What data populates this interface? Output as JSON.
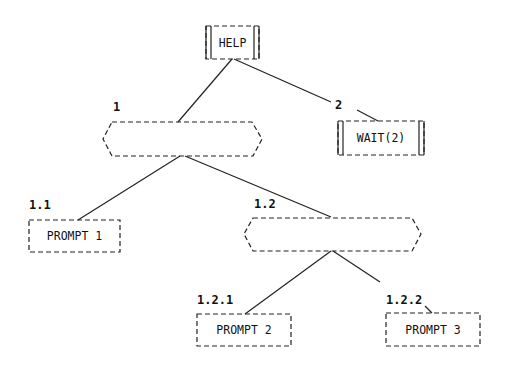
{
  "diagram": {
    "type": "tree",
    "root": {
      "id": "help",
      "label": "HELP",
      "shape": "double-bar-box"
    },
    "nodes": [
      {
        "id": "seq1",
        "number": "1",
        "label": "",
        "shape": "hexagon"
      },
      {
        "id": "wait",
        "number": "2",
        "label": "WAIT(2)",
        "shape": "double-bar-box"
      },
      {
        "id": "prompt1",
        "number": "1.1",
        "label": "PROMPT 1",
        "shape": "box"
      },
      {
        "id": "seq12",
        "number": "1.2",
        "label": "",
        "shape": "hexagon"
      },
      {
        "id": "prompt2",
        "number": "1.2.1",
        "label": "PROMPT 2",
        "shape": "box"
      },
      {
        "id": "prompt3",
        "number": "1.2.2",
        "label": "PROMPT 3",
        "shape": "box"
      }
    ],
    "edges": [
      [
        "help",
        "seq1"
      ],
      [
        "help",
        "wait"
      ],
      [
        "seq1",
        "prompt1"
      ],
      [
        "seq1",
        "seq12"
      ],
      [
        "seq12",
        "prompt2"
      ],
      [
        "seq12",
        "prompt3"
      ]
    ]
  },
  "labels": {
    "help": "HELP",
    "wait": "WAIT(2)",
    "n1": "1",
    "n2": "2",
    "n11": "1.1",
    "n12": "1.2",
    "n121": "1.2.1",
    "n122": "1.2.2",
    "prompt1": "PROMPT 1",
    "prompt2": "PROMPT 2",
    "prompt3": "PROMPT 3"
  }
}
